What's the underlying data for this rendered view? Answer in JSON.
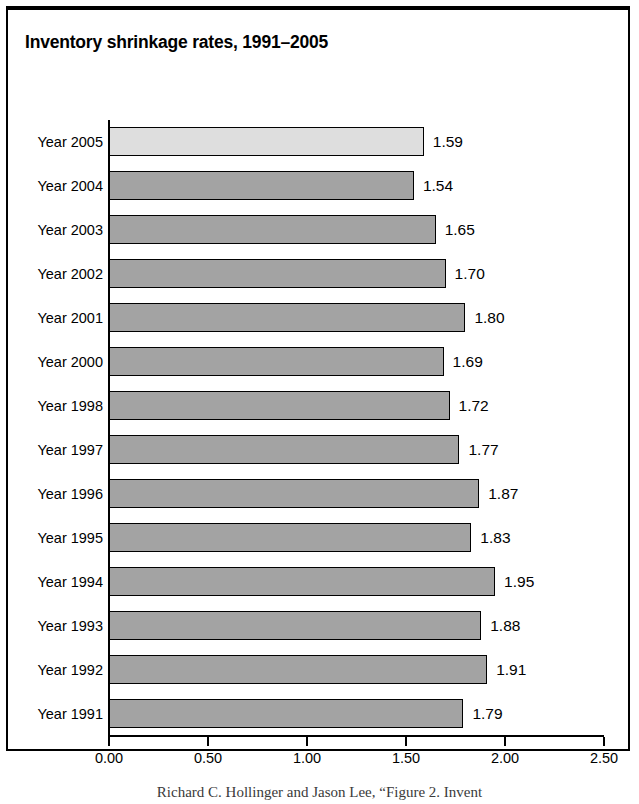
{
  "figure": {
    "title": "Inventory shrinkage rates, 1991–2005",
    "caption": "Richard C. Hollinger and Jason Lee, “Figure 2. Invent"
  },
  "chart_data": {
    "type": "bar",
    "orientation": "horizontal",
    "title": "Inventory shrinkage rates, 1991–2005",
    "xlabel": "",
    "ylabel": "",
    "xlim": [
      0.0,
      2.5
    ],
    "xticks": [
      "0.00",
      "0.50",
      "1.00",
      "1.50",
      "2.00",
      "2.50"
    ],
    "xtick_values": [
      0.0,
      0.5,
      1.0,
      1.5,
      2.0,
      2.5
    ],
    "grid": false,
    "legend": "none",
    "highlight_color": "#dedede",
    "bar_color": "#a3a3a3",
    "categories": [
      "Year 2005",
      "Year 2004",
      "Year 2003",
      "Year 2002",
      "Year 2001",
      "Year 2000",
      "Year 1998",
      "Year 1997",
      "Year 1996",
      "Year 1995",
      "Year 1994",
      "Year 1993",
      "Year 1992",
      "Year 1991"
    ],
    "values": [
      1.59,
      1.54,
      1.65,
      1.7,
      1.8,
      1.69,
      1.72,
      1.77,
      1.87,
      1.83,
      1.95,
      1.88,
      1.91,
      1.79
    ],
    "value_labels": [
      "1.59",
      "1.54",
      "1.65",
      "1.70",
      "1.80",
      "1.69",
      "1.72",
      "1.77",
      "1.87",
      "1.83",
      "1.95",
      "1.88",
      "1.91",
      "1.79"
    ],
    "highlighted_index": 0,
    "bars": [
      {
        "label": "Year 2005",
        "value": 1.59,
        "value_label": "1.59",
        "highlighted": true
      },
      {
        "label": "Year 2004",
        "value": 1.54,
        "value_label": "1.54",
        "highlighted": false
      },
      {
        "label": "Year 2003",
        "value": 1.65,
        "value_label": "1.65",
        "highlighted": false
      },
      {
        "label": "Year 2002",
        "value": 1.7,
        "value_label": "1.70",
        "highlighted": false
      },
      {
        "label": "Year 2001",
        "value": 1.8,
        "value_label": "1.80",
        "highlighted": false
      },
      {
        "label": "Year 2000",
        "value": 1.69,
        "value_label": "1.69",
        "highlighted": false
      },
      {
        "label": "Year 1998",
        "value": 1.72,
        "value_label": "1.72",
        "highlighted": false
      },
      {
        "label": "Year 1997",
        "value": 1.77,
        "value_label": "1.77",
        "highlighted": false
      },
      {
        "label": "Year 1996",
        "value": 1.87,
        "value_label": "1.87",
        "highlighted": false
      },
      {
        "label": "Year 1995",
        "value": 1.83,
        "value_label": "1.83",
        "highlighted": false
      },
      {
        "label": "Year 1994",
        "value": 1.95,
        "value_label": "1.95",
        "highlighted": false
      },
      {
        "label": "Year 1993",
        "value": 1.88,
        "value_label": "1.88",
        "highlighted": false
      },
      {
        "label": "Year 1992",
        "value": 1.91,
        "value_label": "1.91",
        "highlighted": false
      },
      {
        "label": "Year 1991",
        "value": 1.79,
        "value_label": "1.79",
        "highlighted": false
      }
    ]
  }
}
